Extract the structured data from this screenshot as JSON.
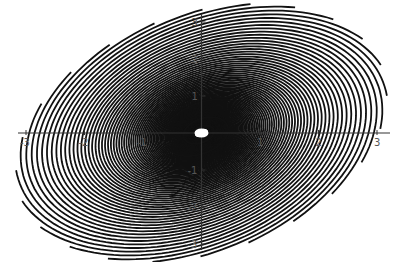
{
  "chart_data": {
    "type": "line",
    "title": "",
    "subtitle": "",
    "xlabel": "",
    "ylabel": "",
    "xlim": [
      -3,
      3
    ],
    "ylim": [
      -3,
      3
    ],
    "grid": false,
    "legend": null,
    "x_ticks": [
      -3,
      -2,
      -1,
      1,
      2,
      3
    ],
    "x_tick_labels": [
      "-3",
      "-2",
      "-1",
      "1",
      "2",
      "3"
    ],
    "y_ticks": [
      -3,
      -2,
      -1,
      1,
      2,
      3
    ],
    "y_tick_labels": [
      "-3",
      "-2",
      "-1",
      "1",
      "2",
      "3"
    ],
    "series": [
      {
        "name": "spiral trajectories",
        "count": 24,
        "form": "r = r0 * exp(k*theta), rotated copies",
        "ellipse_aspect": 0.63,
        "growth_k": 0.12,
        "max_radius": 3.3
      }
    ],
    "center_marker": {
      "shape": "ellipse",
      "x": 0,
      "y": 0,
      "rx": 0.12,
      "ry": 0.07,
      "fill": "#ffffff"
    }
  },
  "style": {
    "curve_color": "#111111",
    "axis_color": "#333333",
    "label_color": "#555555"
  }
}
